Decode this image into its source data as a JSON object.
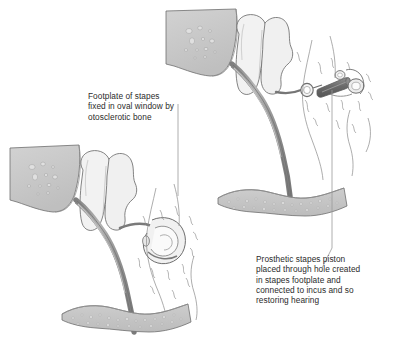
{
  "illustration": {
    "title": "Otosclerosis and stapes prosthesis",
    "background_color": "#ffffff",
    "line_color": "#6b6b6b",
    "text_color": "#2b2b2b"
  },
  "captions": {
    "otosclerosis": "Footplate of stapes\nfixed in oval window by\notosclerotic bone",
    "prosthesis": "Prosthetic stapes piston\nplaced through hole created\nin stapes footplate and\nconnected to incus and so\nrestoring hearing"
  },
  "palette": {
    "bone_wedge_fill": "#c9c9c9",
    "bone_wedge_speckle": "#dedede",
    "ossicle_fill": "#f2f2f2",
    "ossicle_shadow": "#e2e2e2",
    "handle_gray": "#8a8a8a",
    "handle_highlight": "#b8b8b8",
    "slab_fill": "#c4c4c4",
    "slab_speckle": "#d8d8d8",
    "piston_dark": "#6f6f6f",
    "piston_light": "#9a9a9a",
    "outline": "#6b6b6b",
    "hairline": "#7a7a7a",
    "leader_line": "#9a9a9a"
  },
  "figures": [
    {
      "name": "prosthesis-figure",
      "position": "upper-right",
      "parts": [
        "temporal-bone-wedge",
        "incus-body",
        "malleus-body",
        "incus-long-process",
        "stapes-prosthesis-piston",
        "piston-wire-loop",
        "oval-window-ring",
        "otosclerotic-bone-strokes",
        "bone-slab"
      ]
    },
    {
      "name": "otosclerosis-figure",
      "position": "lower-left",
      "parts": [
        "temporal-bone-wedge",
        "incus-body",
        "malleus-body",
        "incus-long-process",
        "fixed-stapes-footplate",
        "otosclerotic-bone-strokes",
        "bone-slab"
      ]
    }
  ]
}
